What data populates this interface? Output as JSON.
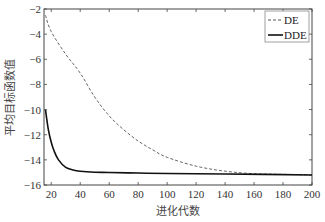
{
  "chart_data": {
    "type": "line",
    "title": "",
    "xlabel": "进化代数",
    "ylabel": "平均目标函数值",
    "xlim": [
      15,
      200
    ],
    "ylim": [
      -16,
      -2
    ],
    "xticks": [
      20,
      40,
      60,
      80,
      100,
      120,
      140,
      160,
      180,
      200
    ],
    "yticks": [
      -2,
      -4,
      -6,
      -8,
      -10,
      -12,
      -14,
      -16
    ],
    "grid": false,
    "legend_position": "upper right",
    "series": [
      {
        "name": "DE",
        "style": "dashed",
        "color": "#555555",
        "x": [
          16,
          20,
          30,
          40,
          50,
          60,
          70,
          80,
          90,
          100,
          120,
          140,
          160,
          180,
          200
        ],
        "y": [
          -2.5,
          -3.8,
          -5.6,
          -7.1,
          -9.0,
          -10.5,
          -11.6,
          -12.5,
          -13.2,
          -13.8,
          -14.5,
          -14.9,
          -15.1,
          -15.15,
          -15.2
        ]
      },
      {
        "name": "DDE",
        "style": "solid",
        "color": "#111111",
        "x": [
          16,
          18,
          20,
          22,
          25,
          30,
          35,
          40,
          50,
          60,
          80,
          100,
          140,
          200
        ],
        "y": [
          -10.0,
          -11.6,
          -12.6,
          -13.3,
          -14.0,
          -14.6,
          -14.8,
          -14.9,
          -14.98,
          -15.0,
          -15.05,
          -15.08,
          -15.12,
          -15.2
        ]
      }
    ]
  },
  "legend": {
    "items": [
      {
        "label": "DE"
      },
      {
        "label": "DDE"
      }
    ]
  },
  "axes": {
    "xlabel": "进化代数",
    "ylabel": "平均目标函数值"
  }
}
